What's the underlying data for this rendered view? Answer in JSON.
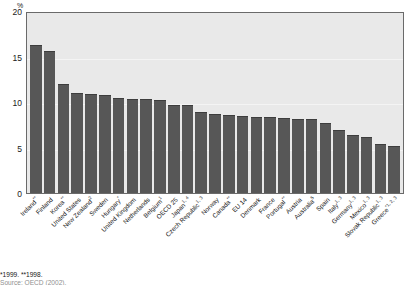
{
  "chart_data": {
    "type": "bar",
    "title": "",
    "xlabel": "",
    "ylabel": "%",
    "ylim": [
      0,
      20
    ],
    "yticks": [
      20,
      15,
      10,
      5,
      0
    ],
    "grid": true,
    "legend": "none",
    "bar_color": "#575757",
    "plot_background": "#e9e9e9",
    "categories": [
      "Ireland**",
      "Finland",
      "Korea**",
      "United States",
      "New Zealand²",
      "Sweden",
      "Hungary*",
      "United Kingdom",
      "Netherlands",
      "Belgium¹",
      "OECD 25",
      "Japan¹´⁴",
      "Czech Republic¹´³",
      "Norway",
      "Canada**",
      "EU 14",
      "Denmark",
      "France",
      "Portugal**",
      "Austria",
      "Australia⁵",
      "Spain",
      "Italy¹´³",
      "Germany¹´³",
      "Mexico¹´³",
      "Slovak Republic¹´³",
      "Greece*¹´²´³"
    ],
    "category_parts": [
      {
        "name": "Ireland",
        "sup": "**"
      },
      {
        "name": "Finland",
        "sup": ""
      },
      {
        "name": "Korea",
        "sup": "**"
      },
      {
        "name": "United States",
        "sup": ""
      },
      {
        "name": "New Zealand",
        "sup": "2"
      },
      {
        "name": "Sweden",
        "sup": ""
      },
      {
        "name": "Hungary",
        "sup": "*"
      },
      {
        "name": "United Kingdom",
        "sup": ""
      },
      {
        "name": "Netherlands",
        "sup": ""
      },
      {
        "name": "Belgium",
        "sup": "1"
      },
      {
        "name": "OECD 25",
        "sup": ""
      },
      {
        "name": "Japan",
        "sup": "1, 4"
      },
      {
        "name": "Czech Republic",
        "sup": "1, 3"
      },
      {
        "name": "Norway",
        "sup": ""
      },
      {
        "name": "Canada",
        "sup": "**"
      },
      {
        "name": "EU 14",
        "sup": ""
      },
      {
        "name": "Denmark",
        "sup": ""
      },
      {
        "name": "France",
        "sup": ""
      },
      {
        "name": "Portugal",
        "sup": "**"
      },
      {
        "name": "Austria",
        "sup": ""
      },
      {
        "name": "Australia",
        "sup": "5"
      },
      {
        "name": "Spain",
        "sup": ""
      },
      {
        "name": "Italy",
        "sup": "1, 3"
      },
      {
        "name": "Germany",
        "sup": "1, 3"
      },
      {
        "name": "Mexico",
        "sup": "1, 3"
      },
      {
        "name": "Slovak Republic",
        "sup": "1, 3"
      },
      {
        "name": "Greece",
        "sup": "*1, 2, 3"
      }
    ],
    "values": [
      16.5,
      15.8,
      12.1,
      11.1,
      11.0,
      10.9,
      10.6,
      10.5,
      10.5,
      10.3,
      9.8,
      9.8,
      9.0,
      8.8,
      8.7,
      8.6,
      8.5,
      8.4,
      8.3,
      8.2,
      8.2,
      7.8,
      7.0,
      6.5,
      6.2,
      5.5,
      5.2
    ]
  },
  "footnotes": {
    "line1": "*1999. **1998.",
    "line2": "Source: OECD (2002)."
  }
}
